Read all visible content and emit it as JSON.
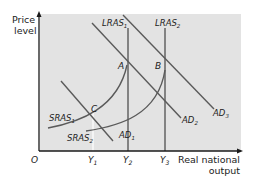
{
  "diagram": {
    "type": "AD-AS model",
    "y_axis_label_line1": "Price",
    "y_axis_label_line2": "level",
    "x_axis_label_line1": "Real national",
    "x_axis_label_line2": "output",
    "origin_label": "O",
    "x_ticks": [
      {
        "base": "Y",
        "sub": "1"
      },
      {
        "base": "Y",
        "sub": "2"
      },
      {
        "base": "Y",
        "sub": "3"
      }
    ],
    "curves": {
      "lras1": {
        "base": "LRAS",
        "sub": "1"
      },
      "lras2": {
        "base": "LRAS",
        "sub": "2"
      },
      "ad1": {
        "base": "AD",
        "sub": "1"
      },
      "ad2": {
        "base": "AD",
        "sub": "2"
      },
      "ad3": {
        "base": "AD",
        "sub": "3"
      },
      "sras1": {
        "base": "SRAS",
        "sub": "1"
      },
      "sras2": {
        "base": "SRAS",
        "sub": "2"
      }
    },
    "points": {
      "a": "A",
      "b": "B",
      "c": "C"
    },
    "colors": {
      "panel": "#e3e3e3",
      "line": "#5a5a5a",
      "axis": "#1a1a1a",
      "text": "#222222"
    }
  }
}
